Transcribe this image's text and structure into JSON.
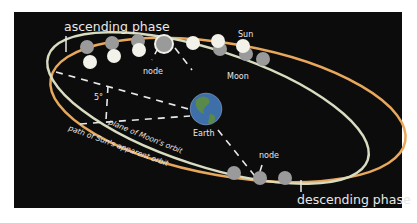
{
  "diagram": {
    "labels": {
      "ascending_phase": "ascending phase",
      "descending_phase": "descending phase",
      "sun": "Sun",
      "moon": "Moon",
      "earth": "Earth",
      "node_top": "node",
      "node_bottom": "node",
      "angle": "5°",
      "moon_orbit": "plane of Moon's orbit",
      "sun_orbit": "path of Sun's apparent orbit"
    },
    "colors": {
      "background": "#0c0c0c",
      "sun_orbit": "#e8a85c",
      "moon_orbit": "#d8dcc0",
      "sun_disc": "#f2f2ea",
      "moon_disc": "#9a9a9a",
      "earth_ocean": "#3e6fa8",
      "earth_land": "#5a8a4a"
    }
  }
}
